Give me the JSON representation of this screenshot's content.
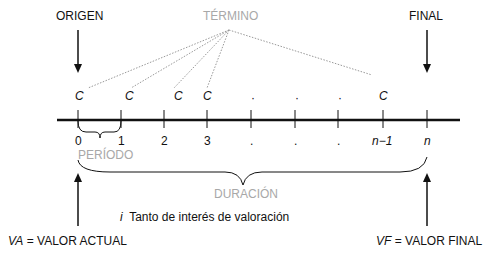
{
  "labels": {
    "origen": "ORIGEN",
    "termino": "TÉRMINO",
    "final": "FINAL",
    "periodo": "PERÍODO",
    "duracion": "DURACIÓN",
    "interest_symbol": "i",
    "interest_text": "Tanto de interés de valoración",
    "va_symbol": "VA",
    "va_text": "= VALOR ACTUAL",
    "vf_symbol": "VF",
    "vf_text": "= VALOR FINAL"
  },
  "payments": [
    "C",
    "C",
    "C",
    "C",
    "C"
  ],
  "ticks": [
    "0",
    "1",
    "2",
    "3",
    ".",
    ".",
    ".",
    "n−1",
    "n"
  ],
  "colors": {
    "main": "#111111",
    "secondary": "#a8a8a8"
  }
}
